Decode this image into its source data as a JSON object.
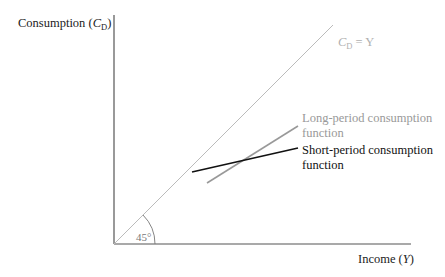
{
  "axes": {
    "y_label": "Consumption (",
    "y_label_var": "C",
    "y_label_sub": "D",
    "y_label_close": ")",
    "x_label": "Income (",
    "x_label_var": "Y",
    "x_label_close": ")"
  },
  "lines": {
    "identity": {
      "label_var": "C",
      "label_sub": "D",
      "label_rest": " = Y",
      "color": "#b8b8b8"
    },
    "long_period": {
      "label_line1": "Long-period consumption",
      "label_line2": "function",
      "color": "#999999"
    },
    "short_period": {
      "label_line1": "Short-period consumption",
      "label_line2": "function",
      "color": "#111111"
    }
  },
  "angle_label": "45°",
  "colors": {
    "axis": "#555555"
  }
}
